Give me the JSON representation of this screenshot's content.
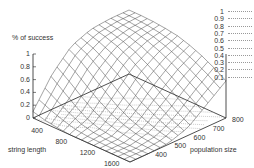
{
  "chart_data": {
    "type": "surface3d",
    "title": "",
    "zlabel": "% of success",
    "xlabel": "string length",
    "ylabel": "population size",
    "z_ticks": [
      "1",
      "0.8",
      "0.6",
      "0.4",
      "0.2",
      "0"
    ],
    "x_ticks": [
      "400",
      "800",
      "1200",
      "1600"
    ],
    "y_ticks": [
      "400",
      "500",
      "600",
      "700",
      "800"
    ],
    "zlim": [
      0,
      1
    ],
    "xlim": [
      200,
      1800
    ],
    "ylim": [
      300,
      800
    ],
    "legend": {
      "position": "top-right",
      "entries": [
        "1",
        "0.9",
        "0.8",
        "0.7",
        "0.6",
        "0.5",
        "0.4",
        "0.3",
        "0.2",
        "0.1"
      ],
      "meaning": "contour levels projected on base"
    },
    "x": [
      200,
      400,
      600,
      800,
      1000,
      1200,
      1400,
      1600,
      1800
    ],
    "y": [
      300,
      400,
      500,
      600,
      700,
      800
    ],
    "z": [
      [
        0.1,
        0.55,
        0.85,
        0.97,
        1.0,
        1.0
      ],
      [
        0.05,
        0.4,
        0.75,
        0.92,
        0.98,
        1.0
      ],
      [
        0.02,
        0.25,
        0.6,
        0.85,
        0.95,
        0.99
      ],
      [
        0.0,
        0.12,
        0.45,
        0.75,
        0.9,
        0.97
      ],
      [
        0.0,
        0.05,
        0.3,
        0.62,
        0.82,
        0.94
      ],
      [
        0.0,
        0.02,
        0.18,
        0.48,
        0.72,
        0.88
      ],
      [
        0.0,
        0.0,
        0.1,
        0.35,
        0.6,
        0.8
      ],
      [
        0.0,
        0.0,
        0.05,
        0.22,
        0.48,
        0.7
      ],
      [
        0.0,
        0.0,
        0.02,
        0.12,
        0.35,
        0.58
      ]
    ],
    "grid": false,
    "contours_on_base": true
  }
}
